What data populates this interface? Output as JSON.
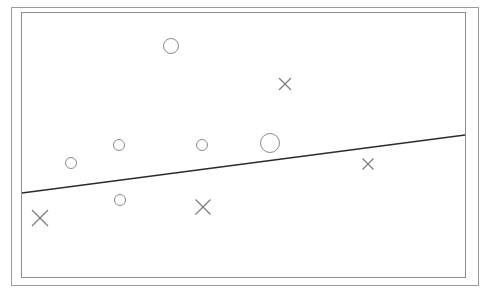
{
  "figure": {
    "width": 485,
    "height": 293,
    "background_color": "#ffffff"
  },
  "frame": {
    "outer": {
      "x": 11,
      "y": 7,
      "width": 467,
      "height": 278,
      "stroke_color": "#9a9a9a",
      "stroke_width": 1
    },
    "inner": {
      "x": 21,
      "y": 12,
      "width": 444,
      "height": 265,
      "stroke_color": "#8e8e8e",
      "stroke_width": 1
    }
  },
  "chart_data": {
    "type": "scatter",
    "title": "",
    "subtitle": "",
    "xlabel": "",
    "ylabel": "",
    "xlim": [
      21,
      465
    ],
    "ylim": [
      12,
      277
    ],
    "grid": false,
    "legend": "none",
    "axis_ticks": [],
    "annotations": [],
    "series": [
      {
        "name": "circles",
        "marker": "open-circle",
        "color": "#8a8a8a",
        "stroke_width": 1,
        "points": [
          {
            "x": 171,
            "y": 46,
            "r": 7.5
          },
          {
            "x": 119,
            "y": 145,
            "r": 5.5
          },
          {
            "x": 71,
            "y": 163,
            "r": 5.5
          },
          {
            "x": 202,
            "y": 145,
            "r": 5.5
          },
          {
            "x": 270,
            "y": 143,
            "r": 9.5
          },
          {
            "x": 120,
            "y": 200,
            "r": 5.5
          }
        ]
      },
      {
        "name": "crosses",
        "marker": "x-cross",
        "color": "#7e7e7e",
        "stroke_width": 1.3,
        "points": [
          {
            "x": 285,
            "y": 84,
            "size": 12
          },
          {
            "x": 368,
            "y": 164,
            "size": 11
          },
          {
            "x": 40,
            "y": 218,
            "size": 16
          },
          {
            "x": 203,
            "y": 207,
            "size": 15
          }
        ]
      }
    ],
    "decision_boundary": {
      "name": "separating-line",
      "type": "line",
      "color": "#2b2b2b",
      "stroke_width": 1.4,
      "x1": 22,
      "y1": 193,
      "x2": 465,
      "y2": 135
    }
  }
}
